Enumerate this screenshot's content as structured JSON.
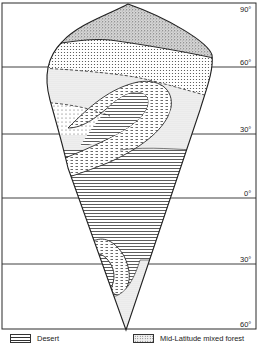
{
  "figure": {
    "type": "idealized continent climate/biome diagram",
    "latitude_labels": [
      {
        "label": "90°",
        "y": 3
      },
      {
        "label": "60°",
        "y": 67
      },
      {
        "label": "30°",
        "y": 134
      },
      {
        "label": "0°",
        "y": 198
      },
      {
        "label": "30°",
        "y": 264
      },
      {
        "label": "60°",
        "y": 329
      }
    ],
    "colors": {
      "line": "#2a2a2a",
      "background": "#ffffff"
    }
  },
  "labels": {
    "lat_90n": "90°",
    "lat_60n": "60°",
    "lat_30n": "30°",
    "lat_0": "0°",
    "lat_30s": "30°",
    "lat_60s": "60°"
  },
  "legend": {
    "items": [
      {
        "pattern": "horizontal-lines",
        "label": "Desert"
      },
      {
        "pattern": "fine-dots",
        "label": "Mid-Latitude mixed forest"
      }
    ]
  }
}
